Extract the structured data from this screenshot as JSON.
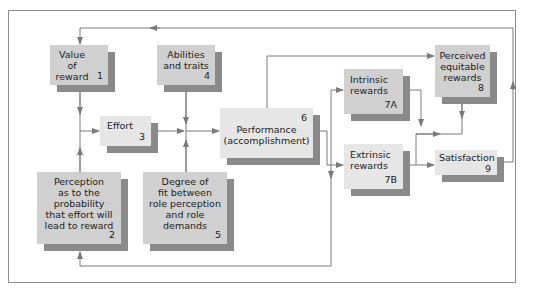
{
  "diagram": {
    "nodes": [
      {
        "id": "1",
        "label": "Value of\nreward",
        "number": "1"
      },
      {
        "id": "2",
        "label": "Perception\nas to the\nprobability\nthat effort will\nlead to reward",
        "number": "2"
      },
      {
        "id": "3",
        "label": "Effort",
        "number": "3"
      },
      {
        "id": "4",
        "label": "Abilities\nand traits",
        "number": "4"
      },
      {
        "id": "5",
        "label": "Degree of\nfit between\nrole perception\nand role\ndemands",
        "number": "5"
      },
      {
        "id": "6",
        "label": "Performance\n(accomplishment)",
        "number": "6"
      },
      {
        "id": "7A",
        "label": "Intrinsic\nrewards",
        "number": "7A"
      },
      {
        "id": "7B",
        "label": "Extrinsic\nrewards",
        "number": "7B"
      },
      {
        "id": "8",
        "label": "Perceived\nequitable\nrewards",
        "number": "8"
      },
      {
        "id": "9",
        "label": "Satisfaction",
        "number": "9"
      }
    ],
    "edges": [
      {
        "from": "1",
        "to": "3"
      },
      {
        "from": "2",
        "to": "3"
      },
      {
        "from": "3",
        "to": "6"
      },
      {
        "from": "4",
        "to": "6"
      },
      {
        "from": "5",
        "to": "6"
      },
      {
        "from": "6",
        "to": "7A"
      },
      {
        "from": "6",
        "to": "7B"
      },
      {
        "from": "6",
        "to": "8"
      },
      {
        "from": "7A",
        "to": "9"
      },
      {
        "from": "7B",
        "to": "9"
      },
      {
        "from": "8",
        "to": "9"
      },
      {
        "from": "9",
        "to": "1"
      },
      {
        "from": "6",
        "to": "2"
      }
    ],
    "colors": {
      "box_fill": "#d0d0d0",
      "box_fill_light": "#e6e6e6",
      "shadow": "#8a8a8a",
      "line": "#7a7a7a",
      "frame": "#8c8c8c"
    }
  }
}
